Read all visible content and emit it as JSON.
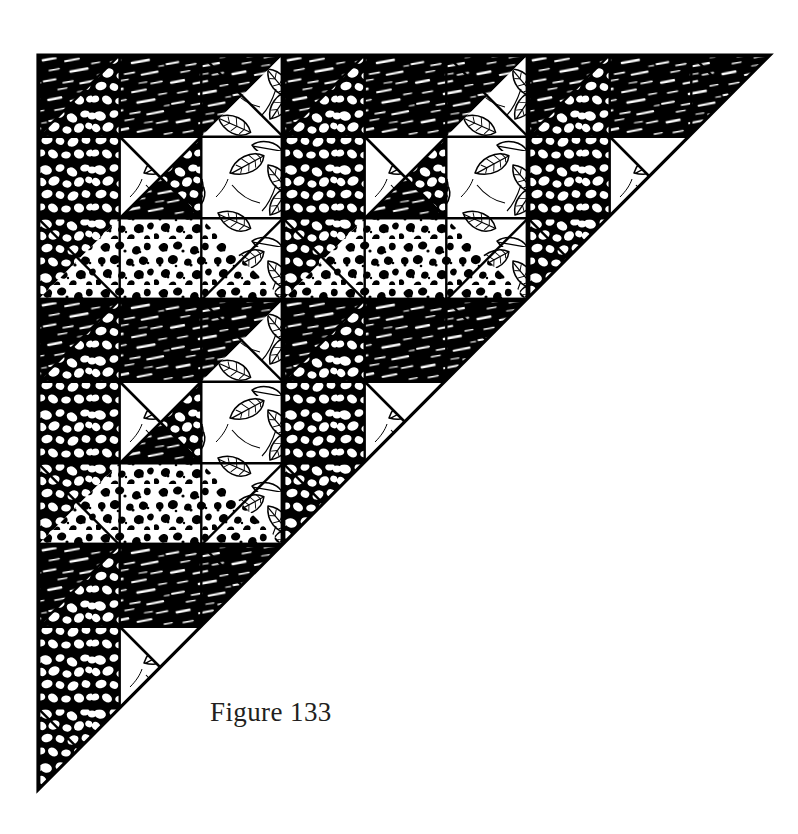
{
  "page": {
    "background_color": "#ffffff",
    "ink_color": "#000000",
    "width": 798,
    "height": 834
  },
  "figure": {
    "caption": "Figure 133",
    "caption_color": "#231f20",
    "title": "Figure 133",
    "shape": "right-triangle",
    "geometry": {
      "corner_top_left": [
        38,
        55
      ],
      "corner_top_right": [
        770,
        55
      ],
      "corner_bottom_left": [
        38,
        790
      ],
      "leg_length": 735,
      "outline_width": 3
    },
    "grid": {
      "block_size": 245,
      "columns": 3,
      "rows": 3,
      "origin_x": 38,
      "origin_y": 55
    },
    "block": {
      "name": "nine-patch-hourglass-block",
      "cells": [
        {
          "position": "top-left",
          "type": "half-square-diagonal",
          "fill_a": "pebble",
          "fill_b": "black-hatch"
        },
        {
          "position": "top-center",
          "type": "edge-triangle",
          "fill_a": "black-hatch",
          "fill_b": "black-hatch"
        },
        {
          "position": "top-right",
          "type": "half-square-diagonal",
          "fill_a": "black-hatch",
          "fill_b": "leaf"
        },
        {
          "position": "middle-left",
          "type": "edge-triangle",
          "fill_a": "pebble",
          "fill_b": "pebble"
        },
        {
          "position": "center",
          "type": "hourglass",
          "fill_top": "white",
          "fill_bottom": "black-hatch",
          "fill_left": "leaf",
          "fill_right": "pebble"
        },
        {
          "position": "middle-right",
          "type": "edge-triangle",
          "fill_a": "leaf",
          "fill_b": "leaf"
        },
        {
          "position": "bottom-left",
          "type": "half-square-diagonal",
          "fill_a": "pebble",
          "fill_b": "speckle"
        },
        {
          "position": "bottom-center",
          "type": "edge-triangle",
          "fill_a": "speckle",
          "fill_b": "speckle"
        },
        {
          "position": "bottom-right",
          "type": "half-square-diagonal",
          "fill_a": "speckle",
          "fill_b": "leaf"
        }
      ]
    },
    "fabrics": [
      {
        "key": "black-hatch",
        "label": "dark hatched fabric",
        "tone": "dark",
        "color": "#000000"
      },
      {
        "key": "pebble",
        "label": "pebble print fabric",
        "tone": "medium",
        "color": "#000000"
      },
      {
        "key": "leaf",
        "label": "leaf print fabric",
        "tone": "light",
        "color": "#000000"
      },
      {
        "key": "speckle",
        "label": "speckled print fabric",
        "tone": "light",
        "color": "#000000"
      },
      {
        "key": "white",
        "label": "plain white fabric",
        "tone": "white",
        "color": "#ffffff"
      }
    ]
  }
}
